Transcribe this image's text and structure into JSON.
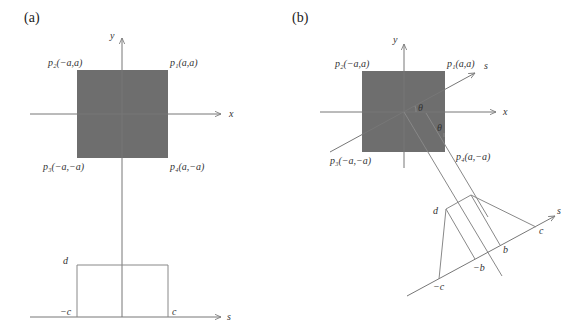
{
  "panel_a": {
    "label": "(a)",
    "axes": {
      "x": "x",
      "y": "y",
      "s": "s"
    },
    "corners": {
      "p1": "p₁(a,a)",
      "p2": "p₂(−a,a)",
      "p3": "p₃(−a,−a)",
      "p4": "p₄(a,−a)"
    },
    "square_color": "#6e6e6e",
    "projection_labels": {
      "height": "d",
      "left": "−c",
      "right": "c"
    }
  },
  "panel_b": {
    "label": "(b)",
    "axes": {
      "x": "x",
      "y": "y",
      "s": "s"
    },
    "corners": {
      "p1": "p₁(a,a)",
      "p2": "p₂(−a,a)",
      "p3": "p₃(−a,−a)",
      "p4": "p₄(a,−a)"
    },
    "angle_labels": [
      "θ",
      "θ"
    ],
    "square_color": "#6e6e6e",
    "projection_labels": {
      "height": "d",
      "neg_c": "−c",
      "neg_b": "−b",
      "pos_b": "b",
      "pos_c": "c"
    }
  }
}
